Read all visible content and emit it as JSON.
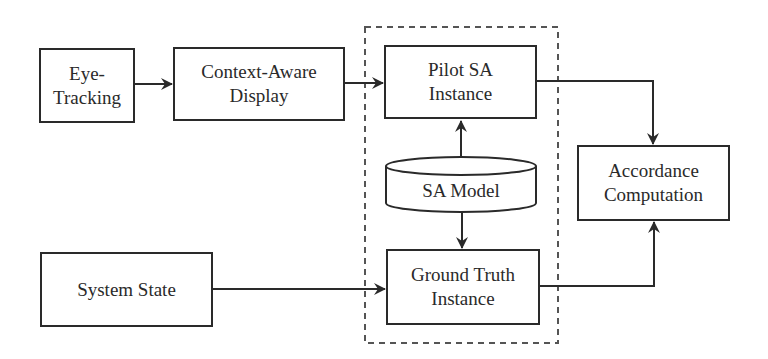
{
  "diagram": {
    "nodes": {
      "eye_tracking": {
        "line1": "Eye-",
        "line2": "Tracking"
      },
      "context_display": {
        "line1": "Context-Aware",
        "line2": "Display"
      },
      "pilot_sa": {
        "line1": "Pilot SA",
        "line2": "Instance"
      },
      "sa_model": {
        "label": "SA Model"
      },
      "ground_truth": {
        "line1": "Ground Truth",
        "line2": "Instance"
      },
      "system_state": {
        "label": "System State"
      },
      "accordance": {
        "line1": "Accordance",
        "line2": "Computation"
      }
    },
    "edges": [
      {
        "from": "Eye-Tracking",
        "to": "Context-Aware Display"
      },
      {
        "from": "Context-Aware Display",
        "to": "Pilot SA Instance"
      },
      {
        "from": "SA Model",
        "to": "Pilot SA Instance"
      },
      {
        "from": "SA Model",
        "to": "Ground Truth Instance"
      },
      {
        "from": "System State",
        "to": "Ground Truth Instance"
      },
      {
        "from": "Pilot SA Instance",
        "to": "Accordance Computation"
      },
      {
        "from": "Ground Truth Instance",
        "to": "Accordance Computation"
      }
    ],
    "colors": {
      "stroke": "#2a2a2a",
      "dash": "#555555",
      "background": "#ffffff"
    }
  }
}
